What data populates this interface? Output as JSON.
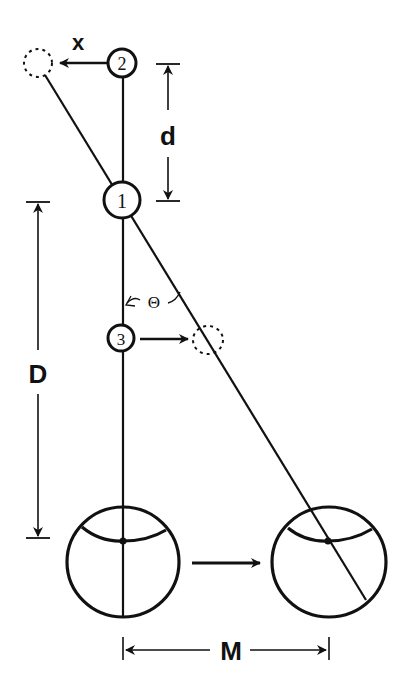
{
  "labels": {
    "x": "x",
    "d": "d",
    "D": "D",
    "M": "M",
    "theta": "Θ"
  },
  "points": [
    {
      "id": "2",
      "label": "2"
    },
    {
      "id": "1",
      "label": "1"
    },
    {
      "id": "3",
      "label": "3"
    }
  ],
  "colors": {
    "stroke": "#111111",
    "background": "#ffffff"
  }
}
